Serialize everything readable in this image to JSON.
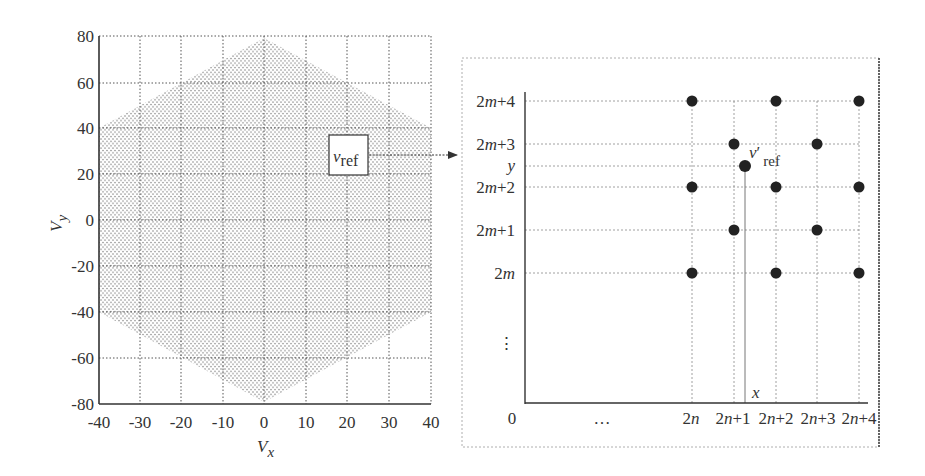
{
  "chart_data": [
    {
      "type": "scatter",
      "title": "",
      "xlabel": "V_x",
      "ylabel": "V_y",
      "xlim": [
        -40,
        40
      ],
      "ylim": [
        -80,
        80
      ],
      "grid": true,
      "x_ticks": [
        "-40",
        "-30",
        "-20",
        "-10",
        "0",
        "10",
        "20",
        "30",
        "40"
      ],
      "y_ticks": [
        "80",
        "60",
        "40",
        "20",
        "0",
        "-20",
        "-40",
        "-60",
        "-80"
      ],
      "region": {
        "shape": "hexagon",
        "vertices": [
          [
            0,
            80
          ],
          [
            40,
            40
          ],
          [
            40,
            -40
          ],
          [
            0,
            -80
          ],
          [
            -40,
            -40
          ],
          [
            -40,
            40
          ]
        ],
        "fill": "dense dot lattice"
      },
      "annotation": {
        "label": "v_ref",
        "at": [
          28,
          30
        ],
        "arrow_to": "right panel"
      }
    },
    {
      "type": "scatter",
      "title": "",
      "x_ticks": [
        "0",
        "...",
        "2n",
        "2n+1",
        "2n+2",
        "2n+3",
        "2n+4"
      ],
      "y_ticks": [
        "2m+4",
        "2m+3",
        "y",
        "2m+2",
        "2m+1",
        "2m",
        "⋮"
      ],
      "points": [
        {
          "x": "2n",
          "y": "2m+4"
        },
        {
          "x": "2n+2",
          "y": "2m+4"
        },
        {
          "x": "2n+4",
          "y": "2m+4"
        },
        {
          "x": "2n+1",
          "y": "2m+3"
        },
        {
          "x": "2n+3",
          "y": "2m+3"
        },
        {
          "x": "2n",
          "y": "2m+2"
        },
        {
          "x": "2n+2",
          "y": "2m+2"
        },
        {
          "x": "2n+4",
          "y": "2m+2"
        },
        {
          "x": "2n+1",
          "y": "2m+1"
        },
        {
          "x": "2n+3",
          "y": "2m+1"
        },
        {
          "x": "2n",
          "y": "2m"
        },
        {
          "x": "2n+2",
          "y": "2m"
        },
        {
          "x": "2n+4",
          "y": "2m"
        }
      ],
      "reference_point": {
        "label": "v'_ref",
        "x": "x",
        "y": "y"
      },
      "grid": true
    }
  ],
  "left": {
    "xlabel_main": "V",
    "xlabel_sub": "x",
    "ylabel_main": "V",
    "ylabel_sub": "y",
    "vref_main": "v",
    "vref_sub": "ref"
  },
  "right": {
    "origin": "0",
    "x_ellipsis": "…",
    "y_ellipsis": "⋮",
    "x_marker": "x",
    "vref_main": "v",
    "vref_prime": "′",
    "vref_sub": "ref"
  }
}
